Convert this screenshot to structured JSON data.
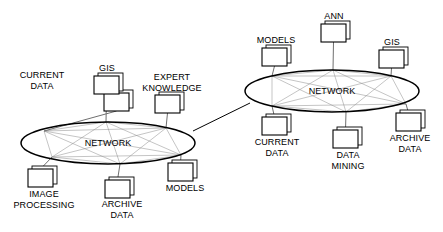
{
  "diagram": {
    "colors": {
      "stroke": "#000000",
      "chord": "#8a8a8a",
      "leader": "#6f6f6f",
      "background": "#ffffff",
      "node_fill": "#ffffff"
    },
    "clusters": [
      {
        "id": "left-network",
        "center_label": "NETWORK",
        "ellipse": {
          "cx": 108,
          "cy": 143,
          "rx": 87,
          "ry": 21
        },
        "nodes": [
          {
            "id": "left-current-data",
            "label": "CURRENT\nDATA",
            "icon": "computer-node-icon",
            "box": {
              "x": 104,
              "y": 93,
              "w": 25,
              "h": 18
            },
            "label_pos": {
              "x": 42,
              "y": 70
            },
            "label_align": "above",
            "anchor": {
              "x": 44,
              "y": 131
            }
          },
          {
            "id": "left-gis",
            "label": "GIS",
            "icon": "computer-node-icon",
            "box": {
              "x": 94,
              "y": 76,
              "w": 25,
              "h": 18
            },
            "label_pos": {
              "x": 107,
              "y": 63
            },
            "label_align": "above",
            "anchor": {
              "x": 106,
              "y": 122
            }
          },
          {
            "id": "left-expert-knowledge",
            "label": "EXPERT\nKNOWLEDGE",
            "icon": "computer-node-icon",
            "box": {
              "x": 155,
              "y": 95,
              "w": 25,
              "h": 18
            },
            "label_pos": {
              "x": 172,
              "y": 72
            },
            "label_align": "above",
            "anchor": {
              "x": 166,
              "y": 128
            }
          },
          {
            "id": "left-image-processing",
            "label": "IMAGE\nPROCESSING",
            "icon": "computer-node-icon",
            "box": {
              "x": 28,
              "y": 169,
              "w": 25,
              "h": 18
            },
            "label_pos": {
              "x": 44,
              "y": 189
            },
            "label_align": "below",
            "anchor": {
              "x": 52,
              "y": 157
            }
          },
          {
            "id": "left-archive-data",
            "label": "ARCHIVE\nDATA",
            "icon": "computer-node-icon",
            "box": {
              "x": 105,
              "y": 180,
              "w": 25,
              "h": 18
            },
            "label_pos": {
              "x": 122,
              "y": 199
            },
            "label_align": "below",
            "anchor": {
              "x": 120,
              "y": 164
            }
          },
          {
            "id": "left-models",
            "label": "MODELS",
            "icon": "computer-node-icon",
            "box": {
              "x": 168,
              "y": 163,
              "w": 25,
              "h": 18
            },
            "label_pos": {
              "x": 185,
              "y": 183
            },
            "label_align": "below",
            "anchor": {
              "x": 181,
              "y": 155
            }
          }
        ]
      },
      {
        "id": "right-network",
        "center_label": "NETWORK",
        "ellipse": {
          "cx": 332,
          "cy": 91,
          "rx": 87,
          "ry": 21
        },
        "nodes": [
          {
            "id": "right-models",
            "label": "MODELS",
            "icon": "computer-node-icon",
            "box": {
              "x": 262,
              "y": 48,
              "w": 25,
              "h": 18
            },
            "label_pos": {
              "x": 276,
              "y": 35
            },
            "label_align": "above",
            "anchor": {
              "x": 272,
              "y": 76
            }
          },
          {
            "id": "right-ann",
            "label": "ANN",
            "icon": "computer-node-icon",
            "box": {
              "x": 321,
              "y": 24,
              "w": 25,
              "h": 18
            },
            "label_pos": {
              "x": 334,
              "y": 11
            },
            "label_align": "above",
            "anchor": {
              "x": 333,
              "y": 70
            }
          },
          {
            "id": "right-gis",
            "label": "GIS",
            "icon": "computer-node-icon",
            "box": {
              "x": 379,
              "y": 50,
              "w": 25,
              "h": 18
            },
            "label_pos": {
              "x": 392,
              "y": 37
            },
            "label_align": "above",
            "anchor": {
              "x": 391,
              "y": 76
            }
          },
          {
            "id": "right-current-data",
            "label": "CURRENT\nDATA",
            "icon": "computer-node-icon",
            "box": {
              "x": 262,
              "y": 117,
              "w": 25,
              "h": 18
            },
            "label_pos": {
              "x": 277,
              "y": 137
            },
            "label_align": "below",
            "anchor": {
              "x": 272,
              "y": 106
            }
          },
          {
            "id": "right-data-mining",
            "label": "DATA\nMINING",
            "icon": "computer-node-icon",
            "box": {
              "x": 333,
              "y": 130,
              "w": 25,
              "h": 18
            },
            "label_pos": {
              "x": 348,
              "y": 150
            },
            "label_align": "below",
            "anchor": {
              "x": 346,
              "y": 112
            }
          },
          {
            "id": "right-archive-data",
            "label": "ARCHIVE\nDATA",
            "icon": "computer-node-icon",
            "box": {
              "x": 396,
              "y": 113,
              "w": 25,
              "h": 18
            },
            "label_pos": {
              "x": 410,
              "y": 133
            },
            "label_align": "below",
            "anchor": {
              "x": 406,
              "y": 104
            }
          }
        ]
      }
    ],
    "inter_cluster_link": {
      "id": "network-to-network-link",
      "from": {
        "x": 193,
        "y": 131
      },
      "to": {
        "x": 250,
        "y": 103
      }
    }
  }
}
